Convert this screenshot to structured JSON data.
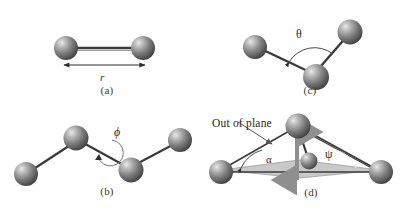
{
  "figure": {
    "background_color": "#ffffff",
    "atom_color": "#6e6e6e",
    "atom_highlight_color": "#d8d8d8",
    "bond_color": "#3a3a3a",
    "plane_fill_color": "#c9c9c9",
    "arrow_color": "#8a8a8a"
  },
  "panels": [
    {
      "id": "a",
      "caption": "(a)",
      "name": "bond-length-panel",
      "description": "Two bonded atoms with a double-headed dimension arrow",
      "labels": [
        {
          "name": "bond-length-label",
          "text": "r",
          "symbol": "r",
          "meaning": "bond length"
        }
      ],
      "atom_count": 2
    },
    {
      "id": "b",
      "caption": "(b)",
      "name": "torsion-angle-panel",
      "description": "Four atoms in a zigzag chain with a rotation arrow about the central bond",
      "labels": [
        {
          "name": "torsion-angle-label",
          "text": "ϕ",
          "symbol": "phi",
          "meaning": "torsion (dihedral) angle"
        }
      ],
      "atom_count": 4
    },
    {
      "id": "c",
      "caption": "(c)",
      "name": "bond-angle-panel",
      "description": "Three atoms forming a bond angle with an arc between the two bonds",
      "labels": [
        {
          "name": "bond-angle-label",
          "text": "θ",
          "symbol": "theta",
          "meaning": "bond angle"
        }
      ],
      "atom_count": 3
    },
    {
      "id": "d",
      "caption": "(d)",
      "name": "out-of-plane-panel",
      "description": "Central atom displaced above a shaded reference plane defined by three atoms",
      "labels": [
        {
          "name": "out-of-plane-label",
          "text": "Out of plane",
          "symbol": "",
          "meaning": "out-of-plane displacement callout"
        },
        {
          "name": "alpha-angle-label",
          "text": "α",
          "symbol": "alpha",
          "meaning": "improper angle alpha"
        },
        {
          "name": "psi-angle-label",
          "text": "ψ",
          "symbol": "psi",
          "meaning": "improper angle psi"
        }
      ],
      "atom_count": 4
    }
  ]
}
